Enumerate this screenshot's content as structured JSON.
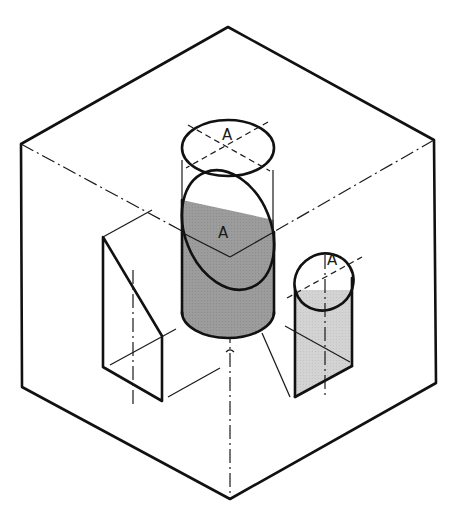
{
  "diagram": {
    "type": "isometric-technical-drawing",
    "colors": {
      "background": "#ffffff",
      "cube_face": "#b4b4b4",
      "light_surface": "#d2d2d2",
      "inclined_surface": "#8c8c8c",
      "cylinder_body": "#9a9a9a",
      "edge": "#111111"
    },
    "labels": {
      "top_ellipse": "A",
      "inclined_ellipse": "A",
      "small_cylinder_ellipse": "A"
    },
    "features": [
      {
        "name": "outer-cube",
        "description": "isometric cube outline"
      },
      {
        "name": "top-projection-ellipse",
        "label": "A"
      },
      {
        "name": "inclined-cut-cylinder",
        "label": "A"
      },
      {
        "name": "small-right-cylinder",
        "label": "A"
      },
      {
        "name": "left-triangular-prism"
      }
    ]
  }
}
